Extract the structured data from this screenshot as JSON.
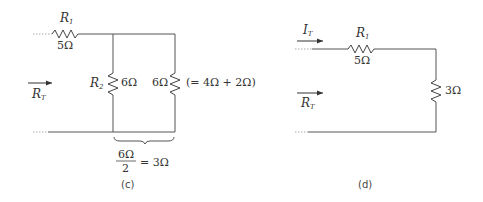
{
  "diagram_c": {
    "caption": "(c)",
    "r1": {
      "name": "R",
      "sub": "1",
      "value": "5Ω"
    },
    "r2": {
      "name": "R",
      "sub": "2",
      "value": "6Ω"
    },
    "r3": {
      "value": "6Ω",
      "note": "(= 4Ω + 2Ω)"
    },
    "rt": {
      "name": "R",
      "sub": "T"
    },
    "brace_num": "6Ω",
    "brace_den": "2",
    "brace_result": "= 3Ω"
  },
  "diagram_d": {
    "caption": "(d)",
    "it": {
      "name": "I",
      "sub": "T"
    },
    "r1": {
      "name": "R",
      "sub": "1",
      "value": "5Ω"
    },
    "r_eq": {
      "value": "3Ω"
    },
    "rt": {
      "name": "R",
      "sub": "T"
    }
  }
}
